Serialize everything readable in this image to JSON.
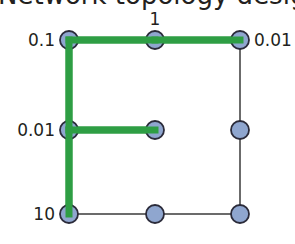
{
  "title": "Network topology design",
  "colors": {
    "node_fill": "#8fa6cf",
    "node_stroke": "#2b2b3a",
    "edge": "#3a3a3a",
    "highlight": "#2e9e44",
    "text": "#231f20"
  },
  "grid": {
    "rows": 3,
    "cols": 3
  },
  "nodes": [
    {
      "id": "n00",
      "row": 0,
      "col": 0
    },
    {
      "id": "n01",
      "row": 0,
      "col": 1
    },
    {
      "id": "n02",
      "row": 0,
      "col": 2
    },
    {
      "id": "n10",
      "row": 1,
      "col": 0
    },
    {
      "id": "n11",
      "row": 1,
      "col": 1
    },
    {
      "id": "n12",
      "row": 1,
      "col": 2
    },
    {
      "id": "n20",
      "row": 2,
      "col": 0
    },
    {
      "id": "n21",
      "row": 2,
      "col": 1
    },
    {
      "id": "n22",
      "row": 2,
      "col": 2
    }
  ],
  "edges": [
    {
      "from": "n00",
      "to": "n01",
      "highlighted": true
    },
    {
      "from": "n01",
      "to": "n02",
      "highlighted": true
    },
    {
      "from": "n00",
      "to": "n10",
      "highlighted": true
    },
    {
      "from": "n10",
      "to": "n20",
      "highlighted": true
    },
    {
      "from": "n10",
      "to": "n11",
      "highlighted": true
    },
    {
      "from": "n02",
      "to": "n12",
      "highlighted": false
    },
    {
      "from": "n12",
      "to": "n22",
      "highlighted": false
    },
    {
      "from": "n20",
      "to": "n21",
      "highlighted": false
    },
    {
      "from": "n21",
      "to": "n22",
      "highlighted": false
    }
  ],
  "labels": [
    {
      "node": "n00",
      "text": "0.1",
      "side": "left"
    },
    {
      "node": "n01",
      "text": "1",
      "side": "top"
    },
    {
      "node": "n02",
      "text": "0.01",
      "side": "right"
    },
    {
      "node": "n10",
      "text": "0.01",
      "side": "left"
    },
    {
      "node": "n20",
      "text": "10",
      "side": "left"
    }
  ]
}
